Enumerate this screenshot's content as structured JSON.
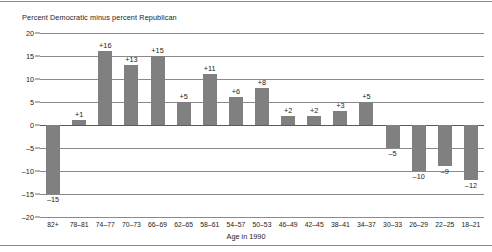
{
  "figure": {
    "title": "Percent Democratic minus percent Republican",
    "xaxis_title": "Age in 1990"
  },
  "chart_data": {
    "type": "bar",
    "title": "Percent Democratic minus percent Republican",
    "xlabel": "Age in 1990",
    "ylabel": "",
    "ylim": [
      -20,
      20
    ],
    "yticks": [
      20,
      15,
      10,
      5,
      0,
      -5,
      -10,
      -15,
      -20
    ],
    "ytick_labels": [
      "20",
      "15",
      "10",
      "5",
      "0",
      "–5",
      "–10",
      "–15",
      "–20"
    ],
    "grid": true,
    "legend": "none",
    "bar_color": "#808080",
    "categories": [
      "82+",
      "78–81",
      "74–77",
      "70–73",
      "66–69",
      "62–65",
      "58–61",
      "54–57",
      "50–53",
      "46–49",
      "42–45",
      "38–41",
      "34–37",
      "30–33",
      "26–29",
      "22–25",
      "18–21"
    ],
    "values": [
      -15,
      1,
      16,
      13,
      15,
      5,
      11,
      6,
      8,
      2,
      2,
      3,
      5,
      -5,
      -10,
      -9,
      -12
    ],
    "value_labels": [
      "–15",
      "+1",
      "+16",
      "+13",
      "+15",
      "+5",
      "+11",
      "+6",
      "+8",
      "+2",
      "+2",
      "+3",
      "+5",
      "–5",
      "–10",
      "–9",
      "–12"
    ]
  }
}
